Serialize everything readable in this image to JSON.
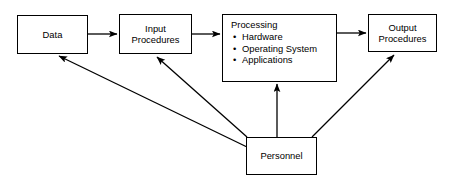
{
  "diagram": {
    "colors": {
      "stroke": "#000000",
      "fill": "#ffffff",
      "text": "#000000"
    },
    "nodes": [
      {
        "id": "data",
        "label": "Data"
      },
      {
        "id": "input",
        "label": "Input\nProcedures"
      },
      {
        "id": "processing",
        "label": "Processing",
        "bullets": [
          "Hardware",
          "Operating System",
          "Applications"
        ],
        "bullet_glyph": "•"
      },
      {
        "id": "output",
        "label": "Output\nProcedures"
      },
      {
        "id": "personnel",
        "label": "Personnel"
      }
    ],
    "edges": [
      {
        "from": "data",
        "to": "input",
        "style": "straight-horizontal"
      },
      {
        "from": "input",
        "to": "processing",
        "style": "straight-horizontal"
      },
      {
        "from": "processing",
        "to": "output",
        "style": "straight-horizontal"
      },
      {
        "from": "personnel",
        "to": "data",
        "style": "diagonal"
      },
      {
        "from": "personnel",
        "to": "input",
        "style": "diagonal"
      },
      {
        "from": "personnel",
        "to": "processing",
        "style": "vertical"
      },
      {
        "from": "personnel",
        "to": "output",
        "style": "diagonal"
      }
    ]
  }
}
